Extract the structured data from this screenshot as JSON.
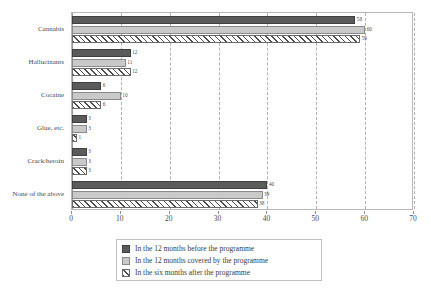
{
  "chart_data": {
    "type": "bar",
    "orientation": "horizontal",
    "title": "",
    "xlabel": "",
    "ylabel": "",
    "xlim": [
      0,
      70
    ],
    "xticks": [
      0,
      10,
      20,
      30,
      40,
      50,
      60,
      70
    ],
    "grid": true,
    "legend_position": "bottom",
    "categories": [
      "Cannabis",
      "Hallucinants",
      "Cocaine",
      "Glue, etc.",
      "Crack/heroin",
      "None of the above"
    ],
    "series": [
      {
        "name": "In the 12 months before the programme",
        "color": "#5b5b5b",
        "values": [
          58,
          12,
          6,
          3,
          3,
          40
        ]
      },
      {
        "name": "In the 12 months covered by the programme",
        "color": "#c9c9c9",
        "values": [
          60,
          11,
          10,
          3,
          3,
          39
        ]
      },
      {
        "name": "In the six months after the programme",
        "color": "#ffffff",
        "hatch": "diagonal",
        "values": [
          59,
          12,
          6,
          1,
          3,
          38
        ]
      }
    ]
  },
  "legend": {
    "items": [
      "In the 12 months before the programme",
      "In the 12 months covered by the programme",
      "In the six months after the programme"
    ]
  }
}
